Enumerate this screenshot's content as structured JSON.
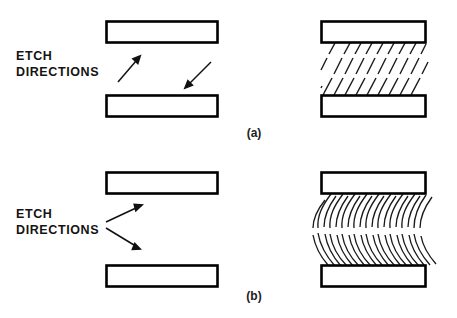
{
  "figure": {
    "title": "Etch Directions",
    "background_color": "#ffffff",
    "line_color": "#000000",
    "width": 457,
    "height": 318
  },
  "panels": [
    {
      "id": "a",
      "label": "(a)",
      "annotation": {
        "line1": "ETCH",
        "line2": "DIRECTIONS"
      },
      "etch_profile": "straight",
      "arrow_count": 2,
      "arrows": [
        {
          "name": "arrow-up-right",
          "direction": "up-right"
        },
        {
          "name": "arrow-down-left",
          "direction": "down-left"
        }
      ],
      "bars": [
        {
          "name": "mask-bar-top-left"
        },
        {
          "name": "mask-bar-bottom-left"
        },
        {
          "name": "mask-bar-top-right"
        },
        {
          "name": "mask-bar-bottom-right"
        }
      ],
      "hatch_count": 9
    },
    {
      "id": "b",
      "label": "(b)",
      "annotation": {
        "line1": "ETCH",
        "line2": "DIRECTIONS"
      },
      "etch_profile": "curved",
      "arrow_count": 2,
      "arrows": [
        {
          "name": "arrow-up-right",
          "direction": "up-right"
        },
        {
          "name": "arrow-down-right",
          "direction": "down-right"
        }
      ],
      "bars": [
        {
          "name": "mask-bar-top-left"
        },
        {
          "name": "mask-bar-bottom-left"
        },
        {
          "name": "mask-bar-top-right"
        },
        {
          "name": "mask-bar-bottom-right"
        }
      ],
      "hatch_count": 9
    }
  ]
}
